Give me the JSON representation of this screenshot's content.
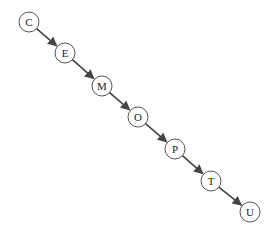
{
  "diagram": {
    "type": "linked-list / directed path",
    "nodes": [
      {
        "id": "C",
        "label": "C",
        "x": 29,
        "y": 22
      },
      {
        "id": "E",
        "label": "E",
        "x": 65,
        "y": 53
      },
      {
        "id": "M",
        "label": "M",
        "x": 102,
        "y": 86
      },
      {
        "id": "O",
        "label": "O",
        "x": 138,
        "y": 117
      },
      {
        "id": "P",
        "label": "P",
        "x": 175,
        "y": 149
      },
      {
        "id": "T",
        "label": "T",
        "x": 211,
        "y": 181
      },
      {
        "id": "U",
        "label": "U",
        "x": 250,
        "y": 212
      }
    ],
    "edges": [
      {
        "from": "C",
        "to": "E"
      },
      {
        "from": "E",
        "to": "M"
      },
      {
        "from": "M",
        "to": "O"
      },
      {
        "from": "O",
        "to": "P"
      },
      {
        "from": "P",
        "to": "T"
      },
      {
        "from": "T",
        "to": "U"
      }
    ],
    "node_radius": 10,
    "colors": {
      "stroke": "#555555",
      "edge": "#444444",
      "fill": "#ffffff"
    }
  }
}
